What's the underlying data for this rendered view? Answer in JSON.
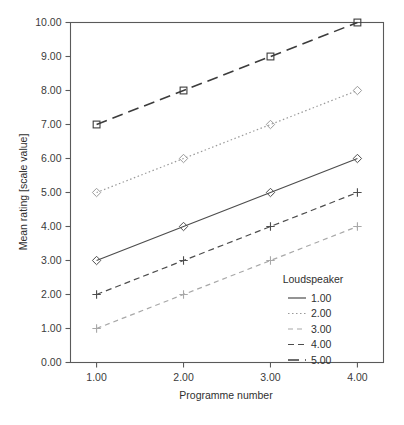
{
  "chart_data": {
    "type": "line",
    "title": "",
    "xlabel": "Programme number",
    "ylabel": "Mean rating [scale value]",
    "x": [
      1,
      2,
      3,
      4
    ],
    "xtick_labels": [
      "1.00",
      "2.00",
      "3.00",
      "4.00"
    ],
    "ytick_labels": [
      "0.00",
      "1.00",
      "2.00",
      "3.00",
      "4.00",
      "5.00",
      "6.00",
      "7.00",
      "8.00",
      "9.00",
      "10.00"
    ],
    "ytick_values": [
      0,
      1,
      2,
      3,
      4,
      5,
      6,
      7,
      8,
      9,
      10
    ],
    "xlim": [
      0.7,
      4.3
    ],
    "ylim": [
      0,
      10
    ],
    "grid": false,
    "legend_position": "inside-bottom-right",
    "legend_title": "Loudspeaker",
    "series": [
      {
        "name": "1.00",
        "values": [
          3,
          4,
          5,
          6
        ],
        "line_style": "solid",
        "marker": "diamond",
        "color": "#4d4d4d",
        "dash": "none",
        "width": 1.2
      },
      {
        "name": "2.00",
        "values": [
          5,
          6,
          7,
          8
        ],
        "line_style": "dotted",
        "marker": "diamond",
        "color": "#9a9a9a",
        "dash": "1.5,2.5",
        "width": 1.2
      },
      {
        "name": "3.00",
        "values": [
          1,
          2,
          3,
          4
        ],
        "line_style": "dashed-light",
        "marker": "plus",
        "color": "#a8a8a8",
        "dash": "5,4",
        "width": 1.2
      },
      {
        "name": "4.00",
        "values": [
          2,
          3,
          4,
          5
        ],
        "line_style": "dashed",
        "marker": "plus",
        "color": "#4d4d4d",
        "dash": "6,4",
        "width": 1.2
      },
      {
        "name": "5.00",
        "values": [
          7,
          8,
          9,
          10
        ],
        "line_style": "long-dash",
        "marker": "square",
        "color": "#3c3c3c",
        "dash": "11,6",
        "width": 1.6
      }
    ]
  },
  "figure": {
    "background_color": "#ffffff",
    "frame_color": "#5a5a5a",
    "text_color": "#2f2f2f"
  }
}
